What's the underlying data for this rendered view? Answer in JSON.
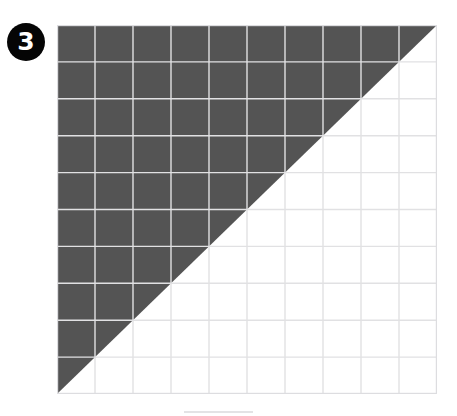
{
  "figure": {
    "badge": {
      "label": "3",
      "icon": "numbered-circle-badge",
      "fill_color": "#050505",
      "text_color": "#ffffff"
    },
    "grid": {
      "columns": 10,
      "rows": 10,
      "total_cells": 100,
      "shaded_cells": 50,
      "shaded_fraction": "1/2",
      "shaded_percent": "50%",
      "shape": "triangle",
      "shaded_region": "upper-left triangle",
      "diagonal_from": "top-right corner",
      "diagonal_to": "bottom-left corner",
      "shade_color": "#545454",
      "line_color": "#e1e1e3",
      "border_color": "#dddde0",
      "background_color": "#ffffff",
      "x": 57,
      "y": 25,
      "width": 380,
      "height": 369
    },
    "bottom_rule": {
      "color": "#e3e3e5",
      "x": 184,
      "y": 411,
      "width": 69,
      "height": 2
    }
  }
}
